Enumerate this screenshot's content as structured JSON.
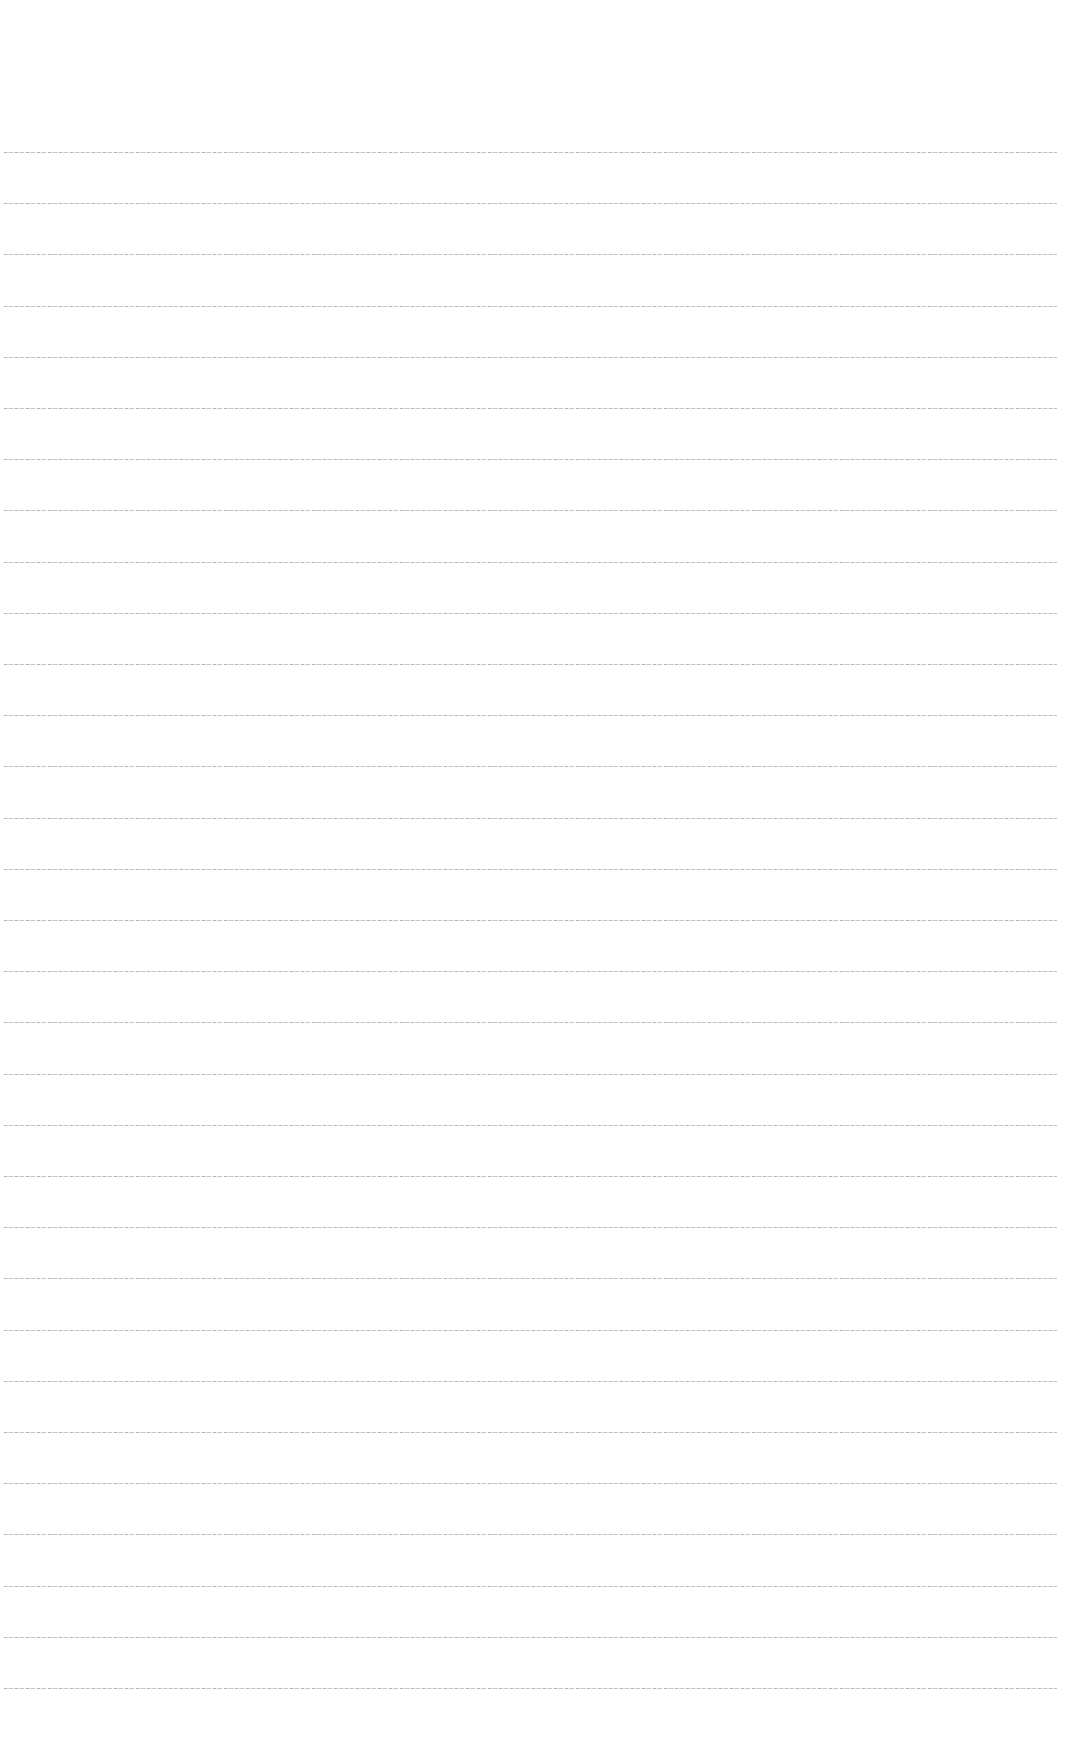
{
  "page": {
    "type": "blank-ruled-sheet",
    "background_color": "#ffffff",
    "rule_color": "#8c8c8c",
    "rule_count": 31,
    "first_rule_y": 152,
    "rule_spacing": 51.2,
    "rule_left": 4,
    "rule_width": 1053
  }
}
